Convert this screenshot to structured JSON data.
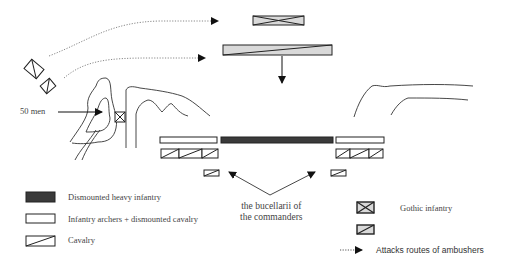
{
  "diagram": {
    "annotations": {
      "fifty_men": "50 men",
      "bucellarii_line1": "the bucellarii of",
      "bucellarii_line2": "the commanders"
    },
    "legend": {
      "items": [
        {
          "symbol": "dismounted-heavy-infantry-swatch",
          "label": "Dismounted heavy infantry"
        },
        {
          "symbol": "infantry-archers-swatch",
          "label": "Infantry archers + dismounted cavalry"
        },
        {
          "symbol": "cavalry-swatch",
          "label": "Cavalry"
        },
        {
          "symbol": "gothic-infantry-swatch",
          "label": "Gothic infantry"
        },
        {
          "symbol": "gothic-cavalry-swatch",
          "label": ""
        },
        {
          "symbol": "dotted-arrow",
          "label": "Attacks routes of ambushers"
        }
      ]
    },
    "colors": {
      "heavy_infantry": "#3a3a3a",
      "gothic_fill": "#d9d9d9",
      "line": "#222222",
      "dotted": "#888888"
    }
  }
}
